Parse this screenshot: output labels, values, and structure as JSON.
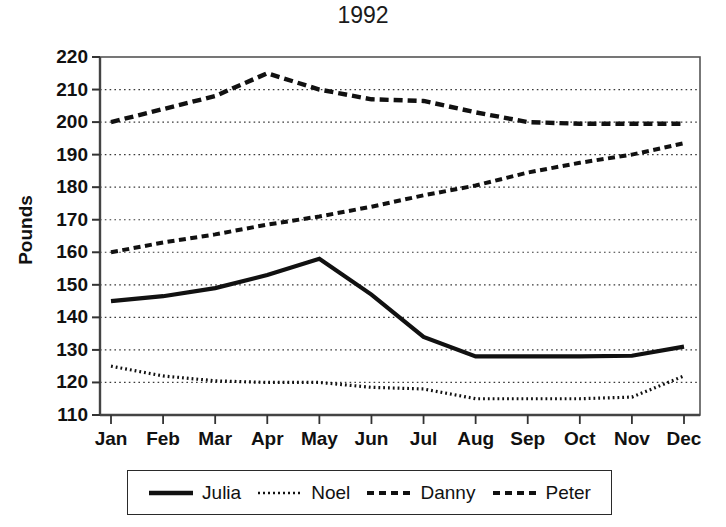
{
  "chart_data": {
    "type": "line",
    "title": "1992",
    "xlabel": "",
    "ylabel": "Pounds",
    "categories": [
      "Jan",
      "Feb",
      "Mar",
      "Apr",
      "May",
      "Jun",
      "Jul",
      "Aug",
      "Sep",
      "Oct",
      "Nov",
      "Dec"
    ],
    "ylim": [
      110,
      220
    ],
    "xlim": [
      0,
      11
    ],
    "y_ticks": [
      110,
      120,
      130,
      140,
      150,
      160,
      170,
      180,
      190,
      200,
      210,
      220
    ],
    "grid": true,
    "legend_position": "bottom",
    "series": [
      {
        "name": "Julia",
        "style": "solid",
        "values": [
          145,
          146.5,
          149,
          153,
          158,
          147,
          134,
          128,
          128,
          128,
          128.2,
          131
        ]
      },
      {
        "name": "Noel",
        "style": "dotted",
        "values": [
          125,
          122,
          120.5,
          120,
          120,
          118.5,
          118,
          115,
          115,
          115,
          115.5,
          122
        ]
      },
      {
        "name": "Danny",
        "style": "dashed",
        "values": [
          160,
          163,
          165.5,
          168.5,
          171,
          174,
          177.5,
          180.5,
          184.5,
          187.5,
          190,
          193.5
        ]
      },
      {
        "name": "Peter",
        "style": "dashed-long",
        "values": [
          200,
          204,
          208,
          215,
          210,
          207,
          206.5,
          203,
          200,
          199.5,
          199.5,
          199.5
        ]
      }
    ]
  },
  "axis": {
    "y_tick_labels": [
      "220",
      "210",
      "200",
      "190",
      "180",
      "170",
      "160",
      "150",
      "140",
      "130",
      "120",
      "110"
    ],
    "x_tick_labels": [
      "Jan",
      "Feb",
      "Mar",
      "Apr",
      "May",
      "Jun",
      "Jul",
      "Aug",
      "Sep",
      "Oct",
      "Nov",
      "Dec"
    ]
  },
  "legend": {
    "entries": [
      {
        "label": "Julia"
      },
      {
        "label": "Noel"
      },
      {
        "label": "Danny"
      },
      {
        "label": "Peter"
      }
    ]
  },
  "colors": {
    "ink": "#111111",
    "grid": "#3a3a3a",
    "axis": "#555555",
    "background": "#ffffff"
  }
}
